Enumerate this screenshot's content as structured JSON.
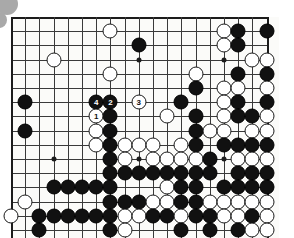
{
  "figure": {
    "kind": "go-board-diagram",
    "board_size": 19,
    "visible_rows": 16,
    "visible_cols": 19,
    "colors": {
      "board_background": "#fbfbf9",
      "grid_line": "#3a3a3a",
      "edge_line": "#1c1c1c",
      "black_stone": "#111111",
      "white_stone": "#ffffff",
      "blob": "#a9a9a9"
    }
  },
  "grid": {
    "origin_x": 0,
    "origin_y": 0,
    "spacing": 14.2,
    "cols": 19,
    "rows": 16
  },
  "star_points": [
    {
      "c": 3,
      "r": 10
    },
    {
      "c": 9,
      "r": 10
    },
    {
      "c": 15,
      "r": 10
    },
    {
      "c": 9,
      "r": 3
    },
    {
      "c": 15,
      "r": 3
    }
  ],
  "stones": [
    {
      "c": 7,
      "r": 1,
      "color": "white"
    },
    {
      "c": 15,
      "r": 1,
      "color": "white"
    },
    {
      "c": 16,
      "r": 1,
      "color": "black"
    },
    {
      "c": 18,
      "r": 1,
      "color": "black"
    },
    {
      "c": 9,
      "r": 2,
      "color": "black"
    },
    {
      "c": 15,
      "r": 2,
      "color": "white"
    },
    {
      "c": 16,
      "r": 2,
      "color": "black"
    },
    {
      "c": 3,
      "r": 3,
      "color": "white"
    },
    {
      "c": 17,
      "r": 3,
      "color": "white"
    },
    {
      "c": 18,
      "r": 3,
      "color": "white"
    },
    {
      "c": 7,
      "r": 4,
      "color": "white"
    },
    {
      "c": 13,
      "r": 4,
      "color": "white"
    },
    {
      "c": 16,
      "r": 4,
      "color": "black"
    },
    {
      "c": 18,
      "r": 4,
      "color": "black"
    },
    {
      "c": 13,
      "r": 5,
      "color": "black"
    },
    {
      "c": 15,
      "r": 5,
      "color": "white"
    },
    {
      "c": 16,
      "r": 5,
      "color": "white"
    },
    {
      "c": 18,
      "r": 5,
      "color": "white"
    },
    {
      "c": 1,
      "r": 6,
      "color": "black"
    },
    {
      "c": 12,
      "r": 6,
      "color": "black"
    },
    {
      "c": 15,
      "r": 6,
      "color": "white"
    },
    {
      "c": 16,
      "r": 6,
      "color": "black"
    },
    {
      "c": 18,
      "r": 6,
      "color": "black"
    },
    {
      "c": 6,
      "r": 6,
      "color": "black",
      "label": "4"
    },
    {
      "c": 7,
      "r": 6,
      "color": "black",
      "label": "2"
    },
    {
      "c": 9,
      "r": 6,
      "color": "white",
      "label": "3"
    },
    {
      "c": 6,
      "r": 7,
      "color": "white",
      "label": "1"
    },
    {
      "c": 7,
      "r": 7,
      "color": "black"
    },
    {
      "c": 11,
      "r": 7,
      "color": "white"
    },
    {
      "c": 13,
      "r": 7,
      "color": "black"
    },
    {
      "c": 15,
      "r": 7,
      "color": "white"
    },
    {
      "c": 16,
      "r": 7,
      "color": "black"
    },
    {
      "c": 17,
      "r": 7,
      "color": "black"
    },
    {
      "c": 18,
      "r": 7,
      "color": "white"
    },
    {
      "c": 1,
      "r": 8,
      "color": "black"
    },
    {
      "c": 6,
      "r": 8,
      "color": "white"
    },
    {
      "c": 7,
      "r": 8,
      "color": "black"
    },
    {
      "c": 13,
      "r": 8,
      "color": "black"
    },
    {
      "c": 14,
      "r": 8,
      "color": "white"
    },
    {
      "c": 15,
      "r": 8,
      "color": "white"
    },
    {
      "c": 17,
      "r": 8,
      "color": "white"
    },
    {
      "c": 18,
      "r": 8,
      "color": "white"
    },
    {
      "c": 6,
      "r": 9,
      "color": "white"
    },
    {
      "c": 7,
      "r": 9,
      "color": "black"
    },
    {
      "c": 8,
      "r": 9,
      "color": "white"
    },
    {
      "c": 9,
      "r": 9,
      "color": "white"
    },
    {
      "c": 10,
      "r": 9,
      "color": "white"
    },
    {
      "c": 12,
      "r": 9,
      "color": "white"
    },
    {
      "c": 13,
      "r": 9,
      "color": "black"
    },
    {
      "c": 15,
      "r": 9,
      "color": "black"
    },
    {
      "c": 16,
      "r": 9,
      "color": "black"
    },
    {
      "c": 17,
      "r": 9,
      "color": "black"
    },
    {
      "c": 18,
      "r": 9,
      "color": "black"
    },
    {
      "c": 7,
      "r": 10,
      "color": "black"
    },
    {
      "c": 8,
      "r": 10,
      "color": "white"
    },
    {
      "c": 10,
      "r": 10,
      "color": "white"
    },
    {
      "c": 11,
      "r": 10,
      "color": "white"
    },
    {
      "c": 12,
      "r": 10,
      "color": "white"
    },
    {
      "c": 13,
      "r": 10,
      "color": "white"
    },
    {
      "c": 14,
      "r": 10,
      "color": "black"
    },
    {
      "c": 16,
      "r": 10,
      "color": "white"
    },
    {
      "c": 17,
      "r": 10,
      "color": "white"
    },
    {
      "c": 18,
      "r": 10,
      "color": "white"
    },
    {
      "c": 7,
      "r": 11,
      "color": "black"
    },
    {
      "c": 8,
      "r": 11,
      "color": "black"
    },
    {
      "c": 9,
      "r": 11,
      "color": "black"
    },
    {
      "c": 10,
      "r": 11,
      "color": "black"
    },
    {
      "c": 11,
      "r": 11,
      "color": "black"
    },
    {
      "c": 12,
      "r": 11,
      "color": "black"
    },
    {
      "c": 13,
      "r": 11,
      "color": "black"
    },
    {
      "c": 14,
      "r": 11,
      "color": "black"
    },
    {
      "c": 16,
      "r": 11,
      "color": "black"
    },
    {
      "c": 17,
      "r": 11,
      "color": "black"
    },
    {
      "c": 18,
      "r": 11,
      "color": "black"
    },
    {
      "c": 3,
      "r": 12,
      "color": "black"
    },
    {
      "c": 4,
      "r": 12,
      "color": "black"
    },
    {
      "c": 5,
      "r": 12,
      "color": "black"
    },
    {
      "c": 6,
      "r": 12,
      "color": "black"
    },
    {
      "c": 7,
      "r": 12,
      "color": "black"
    },
    {
      "c": 11,
      "r": 12,
      "color": "white"
    },
    {
      "c": 12,
      "r": 12,
      "color": "black"
    },
    {
      "c": 13,
      "r": 12,
      "color": "black"
    },
    {
      "c": 15,
      "r": 12,
      "color": "black"
    },
    {
      "c": 16,
      "r": 12,
      "color": "black"
    },
    {
      "c": 17,
      "r": 12,
      "color": "black"
    },
    {
      "c": 18,
      "r": 12,
      "color": "black"
    },
    {
      "c": 1,
      "r": 13,
      "color": "white"
    },
    {
      "c": 7,
      "r": 13,
      "color": "black"
    },
    {
      "c": 8,
      "r": 13,
      "color": "black"
    },
    {
      "c": 9,
      "r": 13,
      "color": "black"
    },
    {
      "c": 10,
      "r": 13,
      "color": "white"
    },
    {
      "c": 11,
      "r": 13,
      "color": "white"
    },
    {
      "c": 12,
      "r": 13,
      "color": "black"
    },
    {
      "c": 13,
      "r": 13,
      "color": "black"
    },
    {
      "c": 14,
      "r": 13,
      "color": "white"
    },
    {
      "c": 15,
      "r": 13,
      "color": "white"
    },
    {
      "c": 16,
      "r": 13,
      "color": "white"
    },
    {
      "c": 17,
      "r": 13,
      "color": "white"
    },
    {
      "c": 18,
      "r": 13,
      "color": "white"
    },
    {
      "c": 0,
      "r": 14,
      "color": "white"
    },
    {
      "c": 2,
      "r": 14,
      "color": "black"
    },
    {
      "c": 3,
      "r": 14,
      "color": "black"
    },
    {
      "c": 4,
      "r": 14,
      "color": "black"
    },
    {
      "c": 5,
      "r": 14,
      "color": "black"
    },
    {
      "c": 6,
      "r": 14,
      "color": "black"
    },
    {
      "c": 7,
      "r": 14,
      "color": "black"
    },
    {
      "c": 8,
      "r": 14,
      "color": "white"
    },
    {
      "c": 9,
      "r": 14,
      "color": "white"
    },
    {
      "c": 10,
      "r": 14,
      "color": "black"
    },
    {
      "c": 11,
      "r": 14,
      "color": "black"
    },
    {
      "c": 12,
      "r": 14,
      "color": "white"
    },
    {
      "c": 13,
      "r": 14,
      "color": "black"
    },
    {
      "c": 14,
      "r": 14,
      "color": "black"
    },
    {
      "c": 15,
      "r": 14,
      "color": "white"
    },
    {
      "c": 16,
      "r": 14,
      "color": "white"
    },
    {
      "c": 17,
      "r": 14,
      "color": "black"
    },
    {
      "c": 18,
      "r": 14,
      "color": "white"
    },
    {
      "c": 2,
      "r": 15,
      "color": "black"
    },
    {
      "c": 7,
      "r": 15,
      "color": "black"
    },
    {
      "c": 8,
      "r": 15,
      "color": "white"
    },
    {
      "c": 12,
      "r": 15,
      "color": "black"
    },
    {
      "c": 14,
      "r": 15,
      "color": "black"
    },
    {
      "c": 16,
      "r": 15,
      "color": "black"
    },
    {
      "c": 17,
      "r": 15,
      "color": "white"
    },
    {
      "c": 18,
      "r": 15,
      "color": "white"
    }
  ],
  "move_labels": [
    "1",
    "2",
    "3",
    "4"
  ]
}
